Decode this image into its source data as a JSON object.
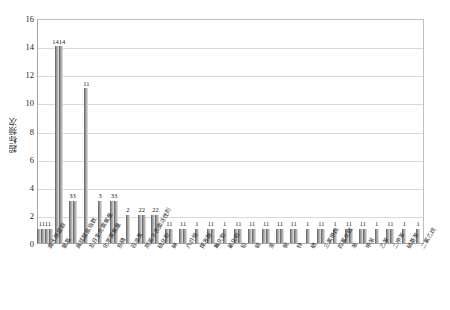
{
  "chart_data": {
    "type": "bar",
    "title": "",
    "xlabel": "",
    "ylabel": "超标频次",
    "ylim": [
      0,
      16
    ],
    "ytick_labels": [
      "0",
      "2",
      "4",
      "6",
      "8",
      "10",
      "12",
      "14",
      "16"
    ],
    "ytick_values": [
      0,
      2,
      4,
      6,
      8,
      10,
      12,
      14,
      16
    ],
    "grid": true,
    "legend": "none",
    "bar_color": "#a0a0a0",
    "groups": [
      {
        "label": "1111",
        "category": "粪大肠菌群",
        "values": [
          1,
          1,
          1,
          1
        ]
      },
      {
        "label": "1414",
        "category": "氨氮",
        "values": [
          14,
          14
        ]
      },
      {
        "label": "33",
        "category": "高锰酸盐指数",
        "values": [
          3,
          3
        ]
      },
      {
        "label": "11",
        "category": "五日生化需氧量",
        "values": [
          11
        ]
      },
      {
        "label": "3",
        "category": "化学需氧量",
        "values": [
          3
        ]
      },
      {
        "label": "33",
        "category": "总磷",
        "values": [
          3,
          3
        ]
      },
      {
        "label": "2",
        "category": "石油类",
        "values": [
          2
        ]
      },
      {
        "label": "22",
        "category": "阴离子表面活性剂",
        "values": [
          2,
          2
        ]
      },
      {
        "label": "22",
        "category": "硫化物",
        "values": [
          2,
          2
        ]
      },
      {
        "label": "11",
        "category": "砷",
        "values": [
          1,
          1
        ]
      },
      {
        "label": "11",
        "category": "六价铬",
        "values": [
          1,
          1
        ]
      },
      {
        "label": "1",
        "category": "挥发酚",
        "values": [
          1
        ]
      },
      {
        "label": "11",
        "category": "氟化物",
        "values": [
          1,
          1
        ]
      },
      {
        "label": "1",
        "category": "氰化物",
        "values": [
          1
        ]
      },
      {
        "label": "11",
        "category": "铅",
        "values": [
          1,
          1
        ]
      },
      {
        "label": "11",
        "category": "镉",
        "values": [
          1,
          1
        ]
      },
      {
        "label": "11",
        "category": "汞",
        "values": [
          1,
          1
        ]
      },
      {
        "label": "11",
        "category": "铜",
        "values": [
          1,
          1
        ]
      },
      {
        "label": "11",
        "category": "锌",
        "values": [
          1,
          1
        ]
      },
      {
        "label": "1",
        "category": "硒",
        "values": [
          1
        ]
      },
      {
        "label": "11",
        "category": "三氯甲烷",
        "values": [
          1,
          1
        ]
      },
      {
        "label": "1",
        "category": "四氯化碳",
        "values": [
          1
        ]
      },
      {
        "label": "11",
        "category": "苯",
        "values": [
          1,
          1
        ]
      },
      {
        "label": "11",
        "category": "甲苯",
        "values": [
          1,
          1
        ]
      },
      {
        "label": "1",
        "category": "乙苯",
        "values": [
          1
        ]
      },
      {
        "label": "11",
        "category": "二甲苯",
        "values": [
          1,
          1
        ]
      },
      {
        "label": "1",
        "category": "硝基苯",
        "values": [
          1
        ]
      },
      {
        "label": "1",
        "category": "二氯乙烷",
        "values": [
          1
        ]
      }
    ]
  },
  "axis": {
    "y_title": "超标频次"
  }
}
